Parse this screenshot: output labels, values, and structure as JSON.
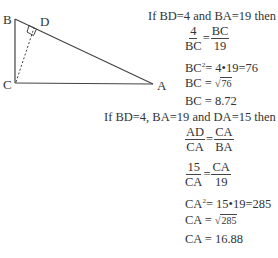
{
  "diagram": {
    "labels": {
      "B": "B",
      "D": "D",
      "C": "C",
      "A": "A"
    },
    "points": {
      "B": [
        15,
        19
      ],
      "C": [
        15,
        83
      ],
      "A": [
        153,
        84
      ],
      "D": [
        34,
        27
      ]
    }
  },
  "part1": {
    "condition": "If BD=4 and BA=19 then",
    "frac_num_left": "4",
    "frac_den_left": "BC",
    "equals": "=",
    "frac_num_right": "BC",
    "frac_den_right": "19",
    "step2": "BC",
    "step2_sup": "2",
    "step2_rest": "= 4•19=76",
    "step3_left": "BC =",
    "step3_sqrt_symbol": "√",
    "step3_radicand": "76",
    "step4": "BC = 8.72"
  },
  "part2": {
    "condition": "If BD=4, BA=19 and DA=15 then",
    "f1_num_left": "AD",
    "f1_den_left": "CA",
    "equals": "=",
    "f1_num_right": "CA",
    "f1_den_right": "BA",
    "f2_num_left": "15",
    "f2_den_left": "CA",
    "f2_num_right": "CA",
    "f2_den_right": "19",
    "step3": "CA",
    "step3_sup": "2",
    "step3_rest": "= 15•19=285",
    "step4_left": "CA =",
    "step4_sqrt_symbol": "√",
    "step4_radicand": "285",
    "step5": "CA = 16.88"
  }
}
